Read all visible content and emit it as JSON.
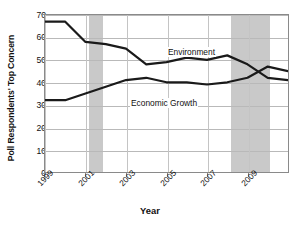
{
  "chart_data": {
    "type": "line",
    "title": "",
    "xlabel": "Year",
    "ylabel": "Poll Respondents' Top Concern",
    "xlim": [
      1999,
      2011
    ],
    "ylim": [
      0,
      70
    ],
    "ytick_values": [
      0,
      10,
      20,
      30,
      40,
      50,
      60,
      70
    ],
    "xtick_values": [
      1999,
      2001,
      2003,
      2005,
      2007,
      2009
    ],
    "xtick_labels": [
      "1999",
      "2001",
      "2003",
      "2005",
      "2007",
      "2009"
    ],
    "grid": "horizontal-and-vertical",
    "legend": "inline-series-labels",
    "x": [
      1999,
      2000,
      2001,
      2002,
      2003,
      2004,
      2005,
      2006,
      2007,
      2008,
      2009,
      2010,
      2011
    ],
    "series": [
      {
        "name": "Environment",
        "values": [
          67,
          67,
          58,
          57,
          55,
          48,
          49,
          51,
          50,
          52,
          48,
          42,
          41
        ],
        "color": "#1a1a1a",
        "label_text": "Environment"
      },
      {
        "name": "Economic Growth",
        "values": [
          32,
          32,
          35,
          38,
          41,
          42,
          40,
          40,
          39,
          40,
          42,
          47,
          45
        ],
        "color": "#1a1a1a",
        "label_text": "Economic Growth"
      }
    ],
    "shaded_bands": [
      {
        "name": "recession-band-2001",
        "start": 2001.15,
        "end": 2001.85,
        "color": "#c9c9c9"
      },
      {
        "name": "recession-band-2008",
        "start": 2008.1,
        "end": 2010.0,
        "color": "#c9c9c9"
      }
    ],
    "annotations": []
  },
  "axis": {
    "y_title": "Poll Respondents' Top Concern",
    "x_title": "Year",
    "y_labels": [
      "70",
      "60",
      "50",
      "40",
      "30",
      "20",
      "10",
      "0"
    ],
    "x_labels": [
      "1999",
      "2001",
      "2003",
      "2005",
      "2007",
      "2009"
    ]
  },
  "series_labels": {
    "environment": "Environment",
    "economic_growth": "Economic Growth"
  },
  "colors": {
    "line": "#1a1a1a",
    "band": "#c9c9c9",
    "grid": "#b9b9b9",
    "frame": "#8a8a8a",
    "background": "#ffffff"
  }
}
